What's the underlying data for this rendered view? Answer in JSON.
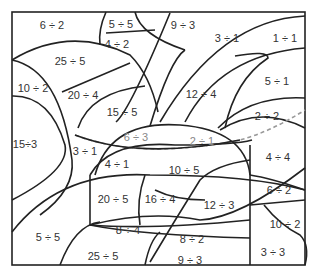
{
  "puzzle": {
    "type": "color-by-division worksheet",
    "regions": [
      {
        "id": "r1",
        "label": "6 ÷ 2",
        "x": 52,
        "y": 25
      },
      {
        "id": "r2",
        "label": "5 ÷ 5",
        "x": 121,
        "y": 24
      },
      {
        "id": "r3",
        "label": "9 ÷ 3",
        "x": 183,
        "y": 25
      },
      {
        "id": "r4",
        "label": "4 ÷ 2",
        "x": 117,
        "y": 44
      },
      {
        "id": "r5",
        "label": "3 ÷ 1",
        "x": 227,
        "y": 38
      },
      {
        "id": "r6",
        "label": "1 ÷ 1",
        "x": 285,
        "y": 38
      },
      {
        "id": "r7",
        "label": "25 ÷ 5",
        "x": 70,
        "y": 61
      },
      {
        "id": "r8",
        "label": "10 ÷ 2",
        "x": 33,
        "y": 88
      },
      {
        "id": "r9",
        "label": "20 ÷ 4",
        "x": 83,
        "y": 95
      },
      {
        "id": "r10",
        "label": "12 ÷ 4",
        "x": 201,
        "y": 94
      },
      {
        "id": "r11",
        "label": "5 ÷ 1",
        "x": 277,
        "y": 81
      },
      {
        "id": "r12",
        "label": "15 ÷ 5",
        "x": 122,
        "y": 112
      },
      {
        "id": "r13",
        "label": "2 ÷ 2",
        "x": 267,
        "y": 116
      },
      {
        "id": "r14",
        "label": "15÷3",
        "x": 25,
        "y": 144
      },
      {
        "id": "r15",
        "label": "6 ÷ 3",
        "x": 136,
        "y": 137,
        "faint": true
      },
      {
        "id": "r16",
        "label": "2 ÷ 1",
        "x": 202,
        "y": 141,
        "faint": true
      },
      {
        "id": "r17",
        "label": "3 ÷ 1",
        "x": 85,
        "y": 151
      },
      {
        "id": "r18",
        "label": "4 ÷ 1",
        "x": 117,
        "y": 164
      },
      {
        "id": "r19",
        "label": "10 ÷ 5",
        "x": 184,
        "y": 170
      },
      {
        "id": "r20",
        "label": "4 ÷ 4",
        "x": 278,
        "y": 157
      },
      {
        "id": "r21",
        "label": "20 ÷ 5",
        "x": 113,
        "y": 199
      },
      {
        "id": "r22",
        "label": "16 ÷ 4",
        "x": 160,
        "y": 199
      },
      {
        "id": "r23",
        "label": "6 ÷ 2",
        "x": 279,
        "y": 190
      },
      {
        "id": "r24",
        "label": "12 ÷ 3",
        "x": 219,
        "y": 205
      },
      {
        "id": "r25",
        "label": "10 ÷ 2",
        "x": 285,
        "y": 224
      },
      {
        "id": "r26",
        "label": "8 ÷ 4",
        "x": 128,
        "y": 230
      },
      {
        "id": "r27",
        "label": "5 ÷ 5",
        "x": 48,
        "y": 237
      },
      {
        "id": "r28",
        "label": "8 ÷ 2",
        "x": 192,
        "y": 239
      },
      {
        "id": "r29",
        "label": "3 ÷ 3",
        "x": 273,
        "y": 252
      },
      {
        "id": "r30",
        "label": "25 ÷ 5",
        "x": 103,
        "y": 256
      },
      {
        "id": "r31",
        "label": "9 ÷ 3",
        "x": 190,
        "y": 260
      }
    ]
  }
}
